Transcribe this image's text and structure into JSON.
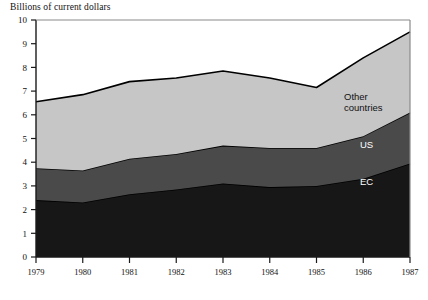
{
  "chart_data": {
    "type": "area",
    "stacked": true,
    "title": "Billions of current dollars",
    "xlabel": "",
    "ylabel": "",
    "grid": false,
    "legend_position": "inline-right",
    "ylim": [
      0,
      10
    ],
    "ytick_labels": [
      "10",
      "9",
      "8",
      "7",
      "6",
      "5",
      "4",
      "3",
      "2",
      "1",
      "0"
    ],
    "yticks": [
      10,
      9,
      8,
      7,
      6,
      5,
      4,
      3,
      2,
      1,
      0
    ],
    "categories": [
      "1979",
      "1980",
      "1981",
      "1982",
      "1983",
      "1984",
      "1985",
      "1986",
      "1987"
    ],
    "x": [
      1979,
      1980,
      1981,
      1982,
      1983,
      1984,
      1985,
      1986,
      1987
    ],
    "series": [
      {
        "name": "EC",
        "label": "EC",
        "color": "#171717",
        "label_color": "#ffffff",
        "values": [
          2.4,
          2.3,
          2.65,
          2.85,
          3.1,
          2.95,
          3.0,
          3.3,
          3.95
        ]
      },
      {
        "name": "US",
        "label": "US",
        "color": "#4a4a4a",
        "label_color": "#ffffff",
        "values": [
          1.35,
          1.35,
          1.5,
          1.5,
          1.6,
          1.65,
          1.6,
          1.8,
          2.15
        ]
      },
      {
        "name": "Other countries",
        "label": "Other countries",
        "label_line1": "Other",
        "label_line2": "countries",
        "color": "#c6c6c6",
        "label_color": "#111111",
        "values": [
          2.8,
          3.2,
          3.25,
          3.2,
          3.15,
          2.95,
          2.55,
          3.3,
          3.4
        ]
      }
    ],
    "cumulative_tops": {
      "ec": [
        2.4,
        2.3,
        2.65,
        2.85,
        3.1,
        2.95,
        3.0,
        3.3,
        3.95
      ],
      "ec_us": [
        3.75,
        3.65,
        4.15,
        4.35,
        4.7,
        4.6,
        4.6,
        5.1,
        6.1
      ],
      "total": [
        6.55,
        6.85,
        7.4,
        7.55,
        7.85,
        7.55,
        7.15,
        8.4,
        9.5
      ]
    },
    "axis_color": "#1a1a1a",
    "outline_color": "#000000",
    "background": "#ffffff"
  }
}
